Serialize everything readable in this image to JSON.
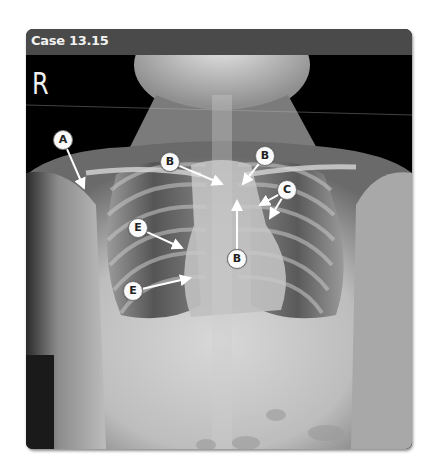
{
  "header": {
    "title": "Case 13.15"
  },
  "image": {
    "type": "chest-radiograph-frontal",
    "side_marker": "R"
  },
  "annotations": [
    {
      "label": "A",
      "cx": 63,
      "cy": 140,
      "targets": [
        [
          84,
          188
        ]
      ]
    },
    {
      "label": "B",
      "cx": 170,
      "cy": 162,
      "targets": [
        [
          222,
          184
        ]
      ]
    },
    {
      "label": "B",
      "cx": 265,
      "cy": 156,
      "targets": [
        [
          243,
          184
        ]
      ]
    },
    {
      "label": "B",
      "cx": 237,
      "cy": 259,
      "targets": [
        [
          237,
          201
        ]
      ]
    },
    {
      "label": "C",
      "cx": 287,
      "cy": 190,
      "targets": [
        [
          260,
          205
        ],
        [
          270,
          218
        ]
      ]
    },
    {
      "label": "E",
      "cx": 138,
      "cy": 228,
      "targets": [
        [
          182,
          248
        ]
      ]
    },
    {
      "label": "E",
      "cx": 133,
      "cy": 291,
      "targets": [
        [
          190,
          278
        ]
      ]
    }
  ],
  "colors": {
    "header_bg": "#4a4a4a",
    "header_text": "#f2f2f2",
    "label_bg": "#fafafa"
  }
}
